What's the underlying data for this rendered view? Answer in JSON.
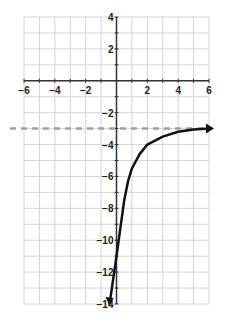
{
  "chart_data": {
    "type": "line",
    "title": "",
    "xlabel": "",
    "ylabel": "",
    "xlim": [
      -6,
      6
    ],
    "ylim": [
      -14,
      4
    ],
    "grid": true,
    "x_ticks": [
      "-6",
      "-4",
      "-2",
      "2",
      "4",
      "6"
    ],
    "y_ticks": [
      "4",
      "2",
      "-2",
      "-4",
      "-6",
      "-8",
      "-10",
      "-12",
      "-14"
    ],
    "asymptote": {
      "y": -3,
      "style": "dashed",
      "color": "#a0a0a0"
    },
    "series": [
      {
        "name": "curve",
        "color": "#111111",
        "x": [
          -0.45,
          0,
          0.5,
          0.75,
          1,
          1.5,
          2,
          3,
          4,
          5,
          6
        ],
        "y": [
          -14,
          -11,
          -7.5,
          -6.3,
          -5.5,
          -4.6,
          -4,
          -3.5,
          -3.2,
          -3.05,
          -3.0
        ]
      }
    ]
  }
}
